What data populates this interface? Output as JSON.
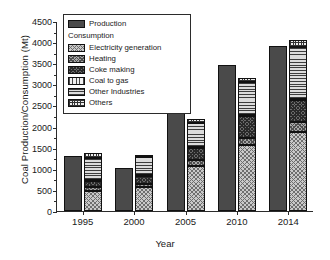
{
  "chart_data": {
    "type": "bar",
    "subtype": "grouped-stacked",
    "title": "",
    "xlabel": "Year",
    "ylabel": "Coal Production/Consumption (Mt)",
    "ylim": [
      0,
      4500
    ],
    "ytick_step": 500,
    "yticks": [
      "0",
      "500",
      "1000",
      "1500",
      "2000",
      "2500",
      "3000",
      "3500",
      "4000",
      "4500"
    ],
    "grid": false,
    "legend_position": "top-left",
    "categories": [
      "1995",
      "2000",
      "2005",
      "2010",
      "2014"
    ],
    "production": {
      "name": "Production",
      "values": [
        1293,
        1010,
        2380,
        3450,
        3900
      ]
    },
    "consumption_total": [
      1375,
      1330,
      2185,
      3150,
      4040
    ],
    "series": [
      {
        "name": "Electricity generation",
        "values": [
          470,
          575,
          1070,
          1555,
          1865
        ]
      },
      {
        "name": "Heating",
        "values": [
          90,
          65,
          130,
          175,
          235
        ]
      },
      {
        "name": "Coke making",
        "values": [
          145,
          185,
          300,
          525,
          530
        ]
      },
      {
        "name": "Coal to gas",
        "values": [
          40,
          30,
          20,
          25,
          30
        ]
      },
      {
        "name": "Other Industries",
        "values": [
          500,
          415,
          575,
          765,
          1235
        ]
      },
      {
        "name": "Others",
        "values": [
          130,
          60,
          90,
          105,
          145
        ]
      }
    ]
  },
  "legend": {
    "production_label": "Production",
    "consumption_header": "Consumption",
    "items": [
      {
        "label": "Electricity generation",
        "swatch": "electricity-swatch"
      },
      {
        "label": "Heating",
        "swatch": "heating-swatch"
      },
      {
        "label": "Coke making",
        "swatch": "coke-making-swatch"
      },
      {
        "label": "Coal to gas",
        "swatch": "coal-to-gas-swatch"
      },
      {
        "label": "Other Industries",
        "swatch": "other-industries-swatch"
      },
      {
        "label": "Others",
        "swatch": "others-swatch"
      }
    ]
  }
}
